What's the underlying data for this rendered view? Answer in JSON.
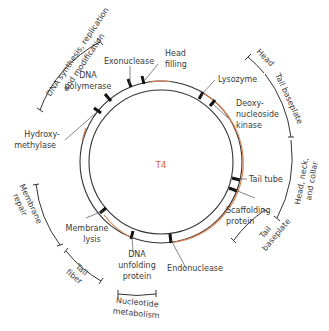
{
  "diagram": {
    "title": "T4",
    "colors": {
      "ring": "#333333",
      "accent": "#d9804e",
      "center_label": "#d9623a",
      "text": "#3a3a3a"
    },
    "genes": [
      {
        "id": "exonuclease",
        "lines": [
          "Exonuclease"
        ]
      },
      {
        "id": "head-filling",
        "lines": [
          "Head",
          "filling"
        ]
      },
      {
        "id": "dna-polymerase",
        "lines": [
          "DNA",
          "polymerase"
        ]
      },
      {
        "id": "lysozyme",
        "lines": [
          "Lysozyme"
        ]
      },
      {
        "id": "deoxynucleoside-kinase",
        "lines": [
          "Deoxy-",
          "nucleoside",
          "kinase"
        ]
      },
      {
        "id": "hydroxymethylase",
        "lines": [
          "Hydroxy-",
          "methylase"
        ]
      },
      {
        "id": "tail-tube",
        "lines": [
          "Tail tube"
        ]
      },
      {
        "id": "scaffolding-protein",
        "lines": [
          "Scaffolding",
          "protein"
        ]
      },
      {
        "id": "membrane-lysis",
        "lines": [
          "Membrane",
          "lysis"
        ]
      },
      {
        "id": "dna-unfolding-protein",
        "lines": [
          "DNA",
          "unfolding",
          "protein"
        ]
      },
      {
        "id": "endonuclease",
        "lines": [
          "Endonuclease"
        ]
      }
    ],
    "regions": [
      {
        "id": "dna-synthesis",
        "lines": [
          "DNA synthesis, replication",
          "and modification"
        ]
      },
      {
        "id": "head",
        "lines": [
          "Head"
        ]
      },
      {
        "id": "tail-baseplate-top",
        "lines": [
          "Tail baseplate"
        ]
      },
      {
        "id": "head-neck-collar",
        "lines": [
          "Head, neck,",
          "and collar"
        ]
      },
      {
        "id": "tail-baseplate-bottom",
        "lines": [
          "Tail",
          "baseplate"
        ]
      },
      {
        "id": "membrane-repair",
        "lines": [
          "Membrane",
          "repair"
        ]
      },
      {
        "id": "tail-fiber",
        "lines": [
          "Tail",
          "fiber"
        ]
      },
      {
        "id": "nucleotide-metabolism",
        "lines": [
          "Nucleotide",
          "metabolism"
        ]
      }
    ]
  }
}
